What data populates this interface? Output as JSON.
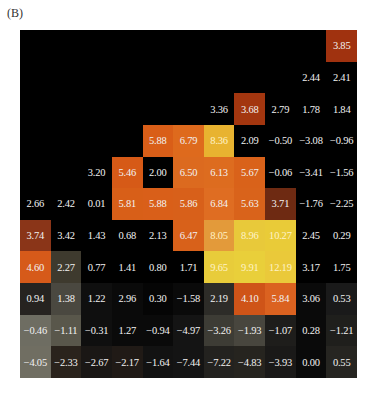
{
  "panel_label": "(B)",
  "chart_data": {
    "type": "heatmap",
    "title": "(B)",
    "rows": 11,
    "cols": 11,
    "note": "Upper-left triangle of cells is empty (black). Values listed row by row top to bottom; null = no value shown.",
    "values": [
      [
        null,
        null,
        null,
        null,
        null,
        null,
        null,
        null,
        null,
        null,
        3.85
      ],
      [
        null,
        null,
        null,
        null,
        null,
        null,
        null,
        null,
        null,
        2.44,
        2.41
      ],
      [
        null,
        null,
        null,
        null,
        null,
        null,
        3.36,
        3.68,
        2.79,
        1.78,
        1.84
      ],
      [
        null,
        null,
        null,
        null,
        5.88,
        6.79,
        8.36,
        2.09,
        -0.5,
        -3.08,
        -0.96
      ],
      [
        null,
        null,
        3.2,
        5.46,
        2.0,
        6.5,
        6.13,
        5.67,
        -0.06,
        -3.41,
        -1.56
      ],
      [
        2.66,
        2.42,
        0.01,
        5.81,
        5.88,
        5.86,
        6.84,
        5.63,
        3.71,
        -1.76,
        -2.25
      ],
      [
        3.74,
        3.42,
        1.43,
        0.68,
        2.13,
        6.47,
        8.05,
        8.96,
        10.27,
        2.45,
        0.29
      ],
      [
        4.6,
        2.27,
        0.77,
        1.41,
        0.8,
        1.71,
        9.65,
        9.91,
        12.19,
        3.17,
        1.75
      ],
      [
        0.94,
        1.38,
        1.22,
        2.96,
        0.3,
        -1.58,
        2.19,
        4.1,
        5.84,
        3.06,
        0.53
      ],
      [
        -0.46,
        -1.11,
        -0.31,
        1.27,
        -0.94,
        -4.97,
        -3.26,
        -1.93,
        -1.07,
        0.28,
        -1.21
      ],
      [
        -4.05,
        -2.33,
        -2.67,
        -2.17,
        -1.64,
        -7.44,
        -7.22,
        -4.83,
        -3.93,
        0.0,
        0.55
      ]
    ],
    "labels": [
      [
        "",
        "",
        "",
        "",
        "",
        "",
        "",
        "",
        "",
        "",
        "3.85"
      ],
      [
        "",
        "",
        "",
        "",
        "",
        "",
        "",
        "",
        "",
        "2.44",
        "2.41"
      ],
      [
        "",
        "",
        "",
        "",
        "",
        "",
        "3.36",
        "3.68",
        "2.79",
        "1.78",
        "1.84"
      ],
      [
        "",
        "",
        "",
        "",
        "5.88",
        "6.79",
        "8.36",
        "2.09",
        "−0.50",
        "−3.08",
        "−0.96"
      ],
      [
        "",
        "",
        "3.20",
        "5.46",
        "2.00",
        "6.50",
        "6.13",
        "5.67",
        "−0.06",
        "−3.41",
        "−1.56"
      ],
      [
        "2.66",
        "2.42",
        "0.01",
        "5.81",
        "5.88",
        "5.86",
        "6.84",
        "5.63",
        "3.71",
        "−1.76",
        "−2.25"
      ],
      [
        "3.74",
        "3.42",
        "1.43",
        "0.68",
        "2.13",
        "6.47",
        "8.05",
        "8.96",
        "10.27",
        "2.45",
        "0.29"
      ],
      [
        "4.60",
        "2.27",
        "0.77",
        "1.41",
        "0.80",
        "1.71",
        "9.65",
        "9.91",
        "12.19",
        "3.17",
        "1.75"
      ],
      [
        "0.94",
        "1.38",
        "1.22",
        "2.96",
        "0.30",
        "−1.58",
        "2.19",
        "4.10",
        "5.84",
        "3.06",
        "0.53"
      ],
      [
        "−0.46",
        "−1.11",
        "−0.31",
        "1.27",
        "−0.94",
        "−4.97",
        "−3.26",
        "−1.93",
        "−1.07",
        "0.28",
        "−1.21"
      ],
      [
        "−4.05",
        "−2.33",
        "−2.67",
        "−2.17",
        "−1.64",
        "−7.44",
        "−7.22",
        "−4.83",
        "−3.93",
        "0.00",
        "0.55"
      ]
    ],
    "colors": [
      [
        "#000000",
        "#000000",
        "#000000",
        "#000000",
        "#000000",
        "#000000",
        "#000000",
        "#000000",
        "#000000",
        "#000000",
        "#a0320f"
      ],
      [
        "#000000",
        "#000000",
        "#000000",
        "#000000",
        "#000000",
        "#000000",
        "#000000",
        "#000000",
        "#000000",
        "#000000",
        "#000000"
      ],
      [
        "#000000",
        "#000000",
        "#000000",
        "#000000",
        "#000000",
        "#000000",
        "#000000",
        "#a3360f",
        "#000000",
        "#000000",
        "#000000"
      ],
      [
        "#000000",
        "#000000",
        "#000000",
        "#000000",
        "#d95e18",
        "#de6a1d",
        "#e8b330",
        "#000000",
        "#000000",
        "#000000",
        "#000000"
      ],
      [
        "#000000",
        "#000000",
        "#000000",
        "#d65a17",
        "#000000",
        "#dc6a1f",
        "#dd6c1f",
        "#d9621a",
        "#000000",
        "#000000",
        "#000000"
      ],
      [
        "#000000",
        "#000000",
        "#000000",
        "#d85f18",
        "#d95f19",
        "#d8601a",
        "#df6d22",
        "#d9631b",
        "#6e2a12",
        "#000000",
        "#000000"
      ],
      [
        "#8a3518",
        "#000000",
        "#000000",
        "#000000",
        "#000000",
        "#d8611a",
        "#e39a3a",
        "#e8c93a",
        "#e9cb38",
        "#000000",
        "#000000"
      ],
      [
        "#d65a1a",
        "#3e3a2e",
        "#000000",
        "#000000",
        "#000000",
        "#000000",
        "#e8cc3a",
        "#e9cf3a",
        "#eac93a",
        "#000000",
        "#000000"
      ],
      [
        "#262320",
        "#4a4840",
        "#0f0f0f",
        "#0a0a0a",
        "#050505",
        "#0a0a0a",
        "#2d2c28",
        "#cf5418",
        "#db6220",
        "#0a0a0a",
        "#1a1a1a"
      ],
      [
        "#6e6d62",
        "#59574b",
        "#0f0f0f",
        "#0a0a0a",
        "#0a0a0a",
        "#141414",
        "#3d3c35",
        "#48463e",
        "#1e1d1b",
        "#0a0a0a",
        "#1f1f1c"
      ],
      [
        "#706e62",
        "#2a231c",
        "#1a1715",
        "#201a16",
        "#121212",
        "#141414",
        "#23221f",
        "#26241f",
        "#1a1918",
        "#0a0a0a",
        "#262521"
      ]
    ]
  }
}
